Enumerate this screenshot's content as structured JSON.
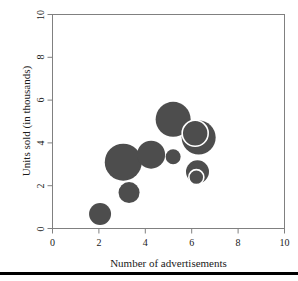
{
  "chart_data": {
    "type": "scatter",
    "title": "",
    "xlabel": "Number of advertisements",
    "ylabel": "Units sold (in thousands)",
    "xlim": [
      0,
      10
    ],
    "ylim": [
      0,
      10
    ],
    "xticks": [
      0,
      2,
      4,
      6,
      8,
      10
    ],
    "yticks": [
      0,
      2,
      4,
      6,
      8,
      10
    ],
    "xtick_labels": [
      "0",
      "2",
      "4",
      "6",
      "8",
      "10"
    ],
    "ytick_labels": [
      "0",
      "2",
      "4",
      "6",
      "8",
      "10"
    ],
    "grid": false,
    "legend": null,
    "marker_style": "bubble",
    "marker_fill": "#4d4d4d",
    "marker_edge": "#ffffff",
    "frame_color": "#808080",
    "background": "#ffffff",
    "note": "Bubble (balloon) plot: marker area encodes a third variable; two markers are drawn with white outlines where bubbles overlap.",
    "points": [
      {
        "x": 2.05,
        "y": 0.68,
        "size": 11.0,
        "ring": false
      },
      {
        "x": 3.3,
        "y": 1.68,
        "size": 10.5,
        "ring": false
      },
      {
        "x": 3.05,
        "y": 3.1,
        "size": 18.5,
        "ring": false
      },
      {
        "x": 4.25,
        "y": 3.45,
        "size": 14.0,
        "ring": false
      },
      {
        "x": 5.2,
        "y": 3.35,
        "size": 7.5,
        "ring": false
      },
      {
        "x": 5.2,
        "y": 5.1,
        "size": 17.5,
        "ring": false
      },
      {
        "x": 6.3,
        "y": 4.25,
        "size": 17.0,
        "ring": false
      },
      {
        "x": 6.15,
        "y": 4.45,
        "size": 13.0,
        "ring": true
      },
      {
        "x": 6.25,
        "y": 2.65,
        "size": 11.5,
        "ring": false
      },
      {
        "x": 6.2,
        "y": 2.4,
        "size": 7.5,
        "ring": true
      }
    ]
  },
  "axes": {
    "x_title": "Number of advertisements",
    "y_title": "Units sold (in thousands)"
  }
}
